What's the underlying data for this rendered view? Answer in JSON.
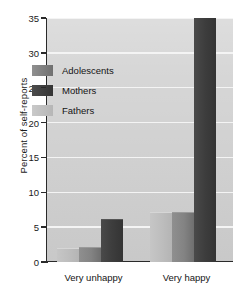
{
  "chart_data": {
    "type": "bar",
    "title": "",
    "xlabel": "",
    "ylabel": "Percent of self-reports",
    "categories": [
      "Very unhappy",
      "Very happy"
    ],
    "ylim": [
      0,
      35
    ],
    "yticks": [
      0,
      5,
      10,
      15,
      20,
      25,
      30,
      35
    ],
    "ytick_labels": [
      "0",
      "5",
      "10",
      "15",
      "20",
      "25",
      "30",
      "35"
    ],
    "grid": true,
    "legend_position": "inside-upper-left",
    "series": [
      {
        "name": "Adolescents",
        "values": [
          2.0,
          7.0
        ],
        "color": "#838383"
      },
      {
        "name": "Mothers",
        "values": [
          6.0,
          35.0
        ],
        "color": "#3d3d3d"
      },
      {
        "name": "Fathers",
        "values": [
          1.8,
          7.0
        ],
        "color": "#bdbdbd"
      }
    ],
    "draw_order": [
      "Fathers",
      "Adolescents",
      "Mothers"
    ],
    "plot_background": "#cfcfcf",
    "gridline_color": "#f4f4f4",
    "axis_color": "#2a2a2a"
  },
  "legend": {
    "items": [
      {
        "label": "Adolescents",
        "key": "adolescents"
      },
      {
        "label": "Mothers",
        "key": "mothers"
      },
      {
        "label": "Fathers",
        "key": "fathers"
      }
    ]
  }
}
